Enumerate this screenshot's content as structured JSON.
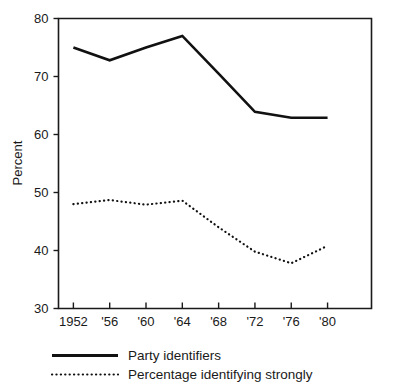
{
  "chart_data": {
    "type": "line",
    "title": "",
    "xlabel": "",
    "ylabel": "Percent",
    "ylim": [
      30,
      80
    ],
    "yticks": [
      30,
      40,
      50,
      60,
      70,
      80
    ],
    "ytick_labels": [
      "30",
      "40",
      "50",
      "60",
      "70",
      "80"
    ],
    "x": [
      1952,
      1956,
      1960,
      1964,
      1968,
      1972,
      1976,
      1980
    ],
    "categories": [
      "1952",
      "'56",
      "'60",
      "'64",
      "'68",
      "'72",
      "'76",
      "'80"
    ],
    "grid": false,
    "legend_position": "below-axes-left",
    "series": [
      {
        "name": "Party identifiers",
        "style": "solid",
        "color": "#111111",
        "values": [
          75.0,
          72.8,
          75.0,
          77.0,
          70.5,
          63.9,
          62.9,
          62.9
        ]
      },
      {
        "name": "Percentage identifying strongly",
        "style": "dotted",
        "color": "#111111",
        "values": [
          48.0,
          48.7,
          47.9,
          48.6,
          44.0,
          39.8,
          37.8,
          40.8
        ]
      }
    ]
  },
  "legend": {
    "items": [
      {
        "label": "Party identifiers",
        "style": "solid"
      },
      {
        "label": "Percentage identifying strongly",
        "style": "dotted"
      }
    ]
  },
  "axes": {
    "y_axis_title": "Percent"
  }
}
